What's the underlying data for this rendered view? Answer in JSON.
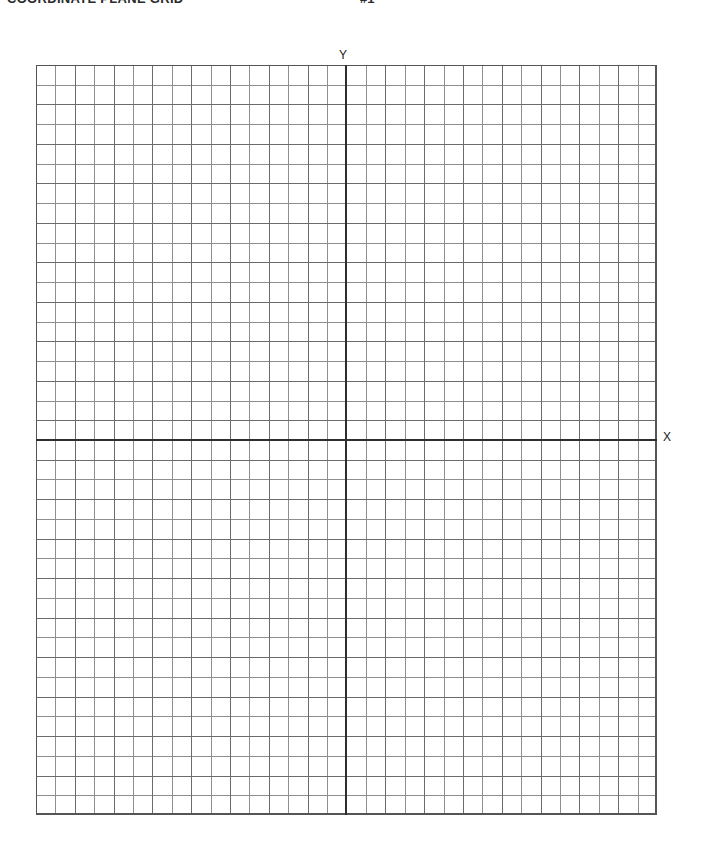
{
  "page": {
    "background_color": "#ffffff",
    "width": 702,
    "height": 852
  },
  "header": {
    "title": "COORDINATE PLANE GRID",
    "page_mark": "#1"
  },
  "axes": {
    "y_label": "Y",
    "x_label": "X",
    "axis_color": "#2e2e2e"
  },
  "grid": {
    "minor_line_color": "#8e8e8e",
    "major_line_color": "#6b6b6b",
    "border_color": "#555555"
  },
  "chart_data": {
    "type": "scatter",
    "title": "COORDINATE PLANE GRID",
    "xlabel": "X",
    "ylabel": "Y",
    "series": [],
    "x": [],
    "values": [],
    "categories": [],
    "xlim": [
      -16,
      16
    ],
    "ylim": [
      -19,
      19
    ],
    "x_major_step": 2,
    "y_major_step": 2,
    "x_minor_step": 1,
    "y_minor_step": 1,
    "columns": 32,
    "rows": 38,
    "grid": true,
    "legend": "none",
    "annotations": []
  }
}
